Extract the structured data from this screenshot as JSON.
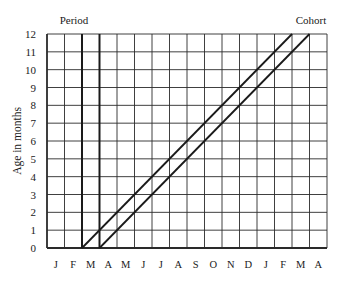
{
  "diagram": {
    "type": "lexis-diagram",
    "top_labels": {
      "period": "Period",
      "cohort": "Cohort"
    },
    "y_axis": {
      "label": "Age in months",
      "ticks": [
        "0",
        "1",
        "2",
        "3",
        "4",
        "5",
        "6",
        "7",
        "8",
        "9",
        "10",
        "11",
        "12"
      ],
      "range": [
        0,
        12
      ]
    },
    "x_axis": {
      "ticks": [
        "J",
        "F",
        "M",
        "A",
        "M",
        "J",
        "J",
        "A",
        "S",
        "O",
        "N",
        "D",
        "J",
        "F",
        "M",
        "A"
      ]
    },
    "period_lines": [
      {
        "x_index": 2,
        "label": "start of March"
      },
      {
        "x_index": 3,
        "label": "start of April"
      }
    ],
    "cohort_lines": [
      {
        "start_x_index": 2,
        "end_x_index": 14,
        "start_age": 0,
        "end_age": 12
      },
      {
        "start_x_index": 3,
        "end_x_index": 15,
        "start_age": 0,
        "end_age": 12
      }
    ],
    "colors": {
      "line": "#1a1a1a",
      "grid": "#2a2a2a",
      "background": "#ffffff"
    }
  }
}
